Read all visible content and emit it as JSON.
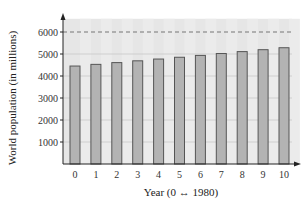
{
  "chart_data": {
    "type": "bar",
    "title": "",
    "xlabel": "Year (0 ↔ 1980)",
    "ylabel": "World population (in millions)",
    "categories": [
      "0",
      "1",
      "2",
      "3",
      "4",
      "5",
      "6",
      "7",
      "8",
      "9",
      "10"
    ],
    "values": [
      4453,
      4529,
      4609,
      4690,
      4771,
      4852,
      4936,
      5022,
      5109,
      5196,
      5285
    ],
    "ylim": [
      0,
      6600
    ],
    "yticks": [
      1000,
      2000,
      3000,
      4000,
      5000,
      6000
    ],
    "grid": true,
    "reference_line": {
      "y": 6000,
      "style": "dashed"
    },
    "legend": null,
    "colors": {
      "bar_fill": "#b3b3b3",
      "bar_stroke": "#555555",
      "plot_bg": "#e6e6e6",
      "alt_stripe": "#d9d9d9",
      "grid": "#c8c8c8",
      "axis": "#222222",
      "dashed_line": "#777777"
    }
  }
}
